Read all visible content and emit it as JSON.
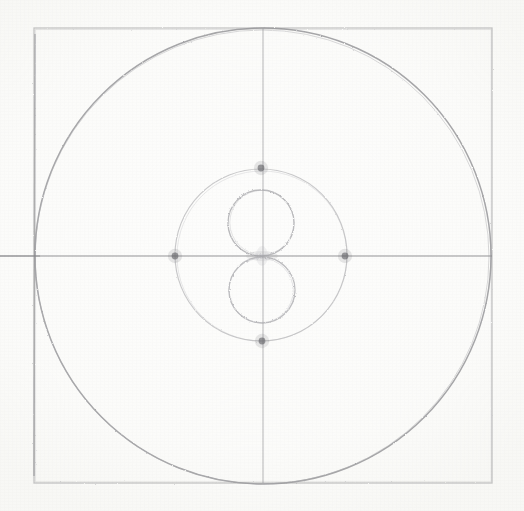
{
  "artwork": {
    "title": "Pencil construction sketch: square with inscribed circle and figure-eight",
    "medium": "graphite pencil on paper",
    "canvas": {
      "width": 524,
      "height": 511
    },
    "background_color": "#fdfdfc",
    "stroke_color": "#9a9a9c",
    "stroke_color_dark": "#6f6f73",
    "stroke_color_light": "#c2c2c4",
    "accent_dot_color": "#5d5d62"
  },
  "shapes": {
    "square": {
      "name": "outer-square",
      "x": 34,
      "y": 28,
      "width": 458,
      "height": 455,
      "stroke_width": 1.2,
      "opacity": 0.55
    },
    "big_circle": {
      "name": "inscribed-circle",
      "cx": 263,
      "cy": 256,
      "r": 228,
      "stroke_width": 1.4,
      "opacity": 0.75
    },
    "inner_circle": {
      "name": "inner-circle",
      "cx": 261,
      "cy": 255,
      "r": 86,
      "stroke_width": 1.1,
      "opacity": 0.5
    },
    "upper_lobe": {
      "name": "figure-eight-upper-circle",
      "cx": 261,
      "cy": 223,
      "r": 33,
      "stroke_width": 1.2,
      "opacity": 0.55
    },
    "lower_lobe": {
      "name": "figure-eight-lower-circle",
      "cx": 262,
      "cy": 290,
      "r": 33,
      "stroke_width": 1.2,
      "opacity": 0.55
    },
    "horizontal_axis": {
      "name": "horizontal-centerline",
      "x1": 0,
      "y1": 256,
      "x2": 492,
      "y2": 256,
      "stroke_width": 1.3,
      "opacity": 0.6
    },
    "vertical_axis": {
      "name": "vertical-centerline",
      "x1": 263,
      "y1": 28,
      "x2": 263,
      "y2": 483,
      "stroke_width": 1.3,
      "opacity": 0.55
    }
  },
  "marks": {
    "label": "cardinal construction dots on inner circle",
    "radius": 3.4,
    "points": [
      {
        "name": "dot-left",
        "cx": 175,
        "cy": 256
      },
      {
        "name": "dot-right",
        "cx": 345,
        "cy": 256
      },
      {
        "name": "dot-top",
        "cx": 261,
        "cy": 168
      },
      {
        "name": "dot-bottom",
        "cx": 262,
        "cy": 341
      }
    ]
  },
  "chart_data": {
    "type": "scatter",
    "xlabel": "",
    "ylabel": "",
    "xlim": [
      0,
      524
    ],
    "ylim": [
      0,
      511
    ],
    "grid": false,
    "legend": "none",
    "annotations": [
      "Outer square drawn freehand, slightly bowed edges",
      "Large circle inscribed in the square, tangent near all four sides",
      "Crosshair axes through the centre; horizontal line runs off the left edge",
      "Concentric inner circle, radius about 86 px",
      "Two tangent circles of radius about 33 px stacked into a figure eight",
      "Four dark graphite dots mark where the inner circle meets the axes"
    ],
    "series": [
      {
        "name": "construction-dots",
        "x": [
          175,
          345,
          261,
          262
        ],
        "y": [
          256,
          256,
          168,
          341
        ],
        "values": [
          3.4,
          3.4,
          3.4,
          3.4
        ]
      }
    ]
  }
}
